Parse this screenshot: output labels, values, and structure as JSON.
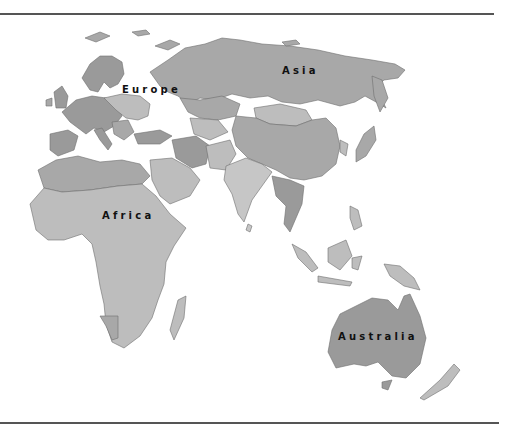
{
  "map": {
    "type": "political region map",
    "projection_view": "Eastern hemisphere: Europe, Africa, Asia, Australia",
    "colors": {
      "background": "#ffffff",
      "rule": "#555555",
      "shade_dark": "#9a9a9a",
      "shade_mid": "#a8a8a8",
      "shade_light": "#bdbdbd",
      "shade_lighter": "#c6c6c6",
      "border": "#6e6e6e",
      "label": "#111111"
    },
    "labels": {
      "europe": "Europe",
      "asia": "Asia",
      "africa": "Africa",
      "australia": "Australia"
    }
  }
}
